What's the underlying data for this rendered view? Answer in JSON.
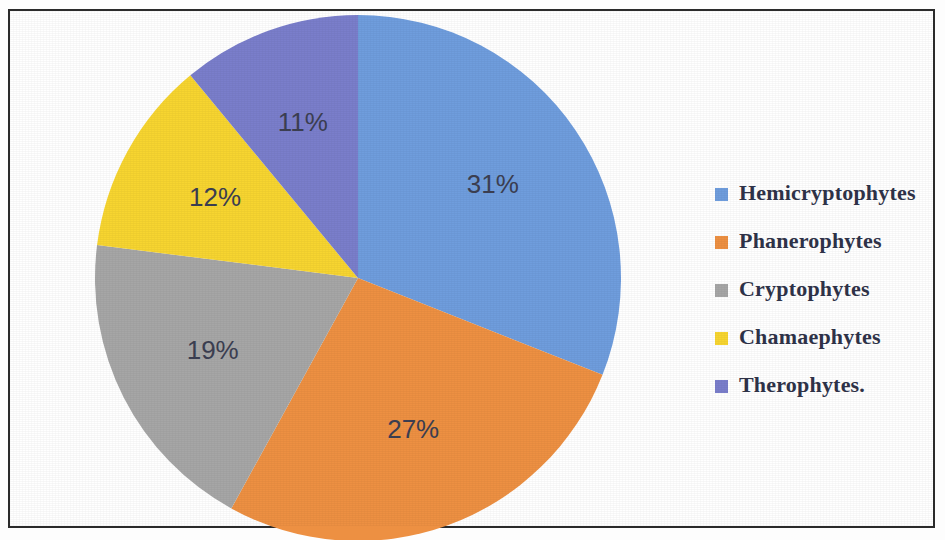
{
  "figure": {
    "background_color": "#ffffff",
    "frame_color": "#2b2b2b",
    "label_text_color": "#3c3f52",
    "legend_text_color": "#2f3349"
  },
  "chart_data": {
    "type": "pie",
    "title": "",
    "subtitle": "",
    "xlabel": "",
    "ylabel": "",
    "grid": false,
    "legend_position": "right",
    "start_angle_deg": 0,
    "direction": "clockwise",
    "units": "percent",
    "categories": [
      "Hemicryptophytes",
      "Phanerophytes",
      "Cryptophytes",
      "Chamaephytes",
      "Therophytes."
    ],
    "values": [
      31,
      27,
      19,
      12,
      11
    ],
    "data_labels": [
      "31%",
      "27%",
      "19%",
      "12%",
      "11%"
    ],
    "colors": [
      "#6f9ddd",
      "#ed9042",
      "#a6a6a6",
      "#f7d530",
      "#7a7ecb"
    ],
    "slices": [
      {
        "label": "Hemicryptophytes",
        "value": 31,
        "data_label": "31%",
        "color": "#6f9ddd"
      },
      {
        "label": "Phanerophytes",
        "value": 27,
        "data_label": "27%",
        "color": "#ed9042"
      },
      {
        "label": "Cryptophytes",
        "value": 19,
        "data_label": "19%",
        "color": "#a6a6a6"
      },
      {
        "label": "Chamaephytes",
        "value": 12,
        "data_label": "12%",
        "color": "#f7d530"
      },
      {
        "label": "Therophytes.",
        "value": 11,
        "data_label": "11%",
        "color": "#7a7ecb"
      }
    ]
  },
  "legend": {
    "items": [
      {
        "label": "Hemicryptophytes",
        "color": "#6f9ddd"
      },
      {
        "label": "Phanerophytes",
        "color": "#ed9042"
      },
      {
        "label": "Cryptophytes",
        "color": "#a6a6a6"
      },
      {
        "label": "Chamaephytes",
        "color": "#f7d530"
      },
      {
        "label": "Therophytes.",
        "color": "#7a7ecb"
      }
    ]
  }
}
